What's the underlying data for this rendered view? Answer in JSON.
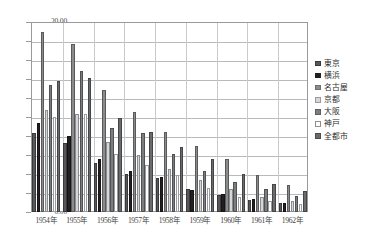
{
  "chart_data": {
    "type": "bar",
    "title": "",
    "subtitle": "",
    "xlabel": "",
    "ylabel": "",
    "ylim": [
      0,
      20
    ],
    "ytick_step": 2,
    "ytick_labels": [
      "0.00",
      "2.00",
      "4.00",
      "6.00",
      "8.00",
      "10.00",
      "12.00",
      "14.00",
      "16.00",
      "18.00",
      "20.00"
    ],
    "grid": true,
    "grid_axis": "y",
    "legend_position": "right",
    "orientation": "vertical",
    "grouping": "clustered",
    "categories": [
      "1954年",
      "1955年",
      "1956年",
      "1957年",
      "1958年",
      "1959年",
      "1960年",
      "1961年",
      "1962年"
    ],
    "series": [
      {
        "name": "東京",
        "color": "#58585a",
        "values": [
          8.3,
          7.25,
          5.2,
          3.95,
          3.55,
          2.45,
          1.75,
          1.25,
          0.95
        ]
      },
      {
        "name": "横浜",
        "color": "#231f20",
        "values": [
          9.4,
          8.05,
          5.55,
          4.3,
          3.7,
          2.35,
          1.9,
          1.35,
          1.0
        ]
      },
      {
        "name": "名古屋",
        "color": "#8a8b8d",
        "values": [
          18.9,
          17.7,
          12.8,
          10.55,
          8.45,
          6.95,
          5.55,
          3.85,
          2.85
        ]
      },
      {
        "name": "京都",
        "color": "#d6d7d9",
        "values": [
          10.75,
          10.35,
          7.35,
          6.05,
          4.55,
          3.35,
          2.4,
          1.55,
          1.15
        ]
      },
      {
        "name": "大阪",
        "color": "#7c7d7f",
        "values": [
          13.35,
          14.8,
          8.85,
          8.35,
          6.1,
          4.35,
          3.15,
          2.45,
          1.7
        ]
      },
      {
        "name": "神戸",
        "color": "#fefefe",
        "values": [
          9.95,
          10.3,
          6.1,
          5.0,
          3.85,
          2.55,
          1.6,
          1.15,
          0.8
        ]
      },
      {
        "name": "全都市",
        "color": "#6a6b6d",
        "values": [
          13.8,
          14.15,
          9.85,
          8.4,
          6.85,
          5.6,
          4.05,
          2.95,
          2.2
        ]
      }
    ]
  },
  "legend": {
    "items": [
      {
        "label": "東京",
        "swatch": "#58585a",
        "border": "#3a3a3c"
      },
      {
        "label": "横浜",
        "swatch": "#231f20",
        "border": "#231f20"
      },
      {
        "label": "名古屋",
        "swatch": "#8a8b8d",
        "border": "#6e6f71"
      },
      {
        "label": "京都",
        "swatch": "#d6d7d9",
        "border": "#9a9b9d"
      },
      {
        "label": "大阪",
        "swatch": "#7c7d7f",
        "border": "#5e5f61"
      },
      {
        "label": "神戸",
        "swatch": "#ffffff",
        "border": "#8e8f91"
      },
      {
        "label": "全都市",
        "swatch": "#6a6b6d",
        "border": "#4c4d4f"
      }
    ]
  },
  "axis": {
    "y_tick_labels": [
      "20.00",
      "18.00",
      "16.00",
      "14.00",
      "12.00",
      "10.00",
      "8.00",
      "6.00",
      "4.00",
      "2.00",
      "0.00"
    ],
    "x_tick_labels": [
      "1954年",
      "1955年",
      "1956年",
      "1957年",
      "1958年",
      "1959年",
      "1960年",
      "1961年",
      "1962年"
    ]
  }
}
